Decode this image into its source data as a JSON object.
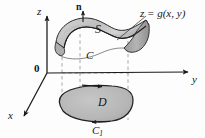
{
  "figure": {
    "axes": {
      "z_label": "z",
      "y_label": "y",
      "x_label": "x",
      "origin_label": "0"
    },
    "labels": {
      "surface": "S",
      "surface_equation_z": "z",
      "surface_equation_eq": "=",
      "surface_equation_fn": "g(x, y)",
      "surface_equation_full": "z = g(x, y)",
      "normal_vector": "n",
      "boundary_curve": "C",
      "region": "D",
      "projected_curve_base": "C",
      "projected_curve_sub": "1",
      "projected_curve_full": "C1"
    },
    "colors": {
      "background": "#fdfdfd",
      "ink": "#151515",
      "axis": "#1a1a1a",
      "dashed": "#9a9a9a",
      "surface_fill_light": "#d8d8d8",
      "surface_fill_mid": "#bdbdbd",
      "surface_fill_dark": "#a0a0a0",
      "region_fill": "#b9b9b9",
      "outline": "#222222"
    },
    "geometry": {
      "origin_point": [
        47,
        73
      ],
      "z_axis_top": [
        47,
        14
      ],
      "y_axis_end": [
        191,
        72
      ],
      "x_axis_end": [
        21,
        118
      ],
      "dashed_verticals_x": [
        62,
        80,
        128
      ],
      "surface_span_x": [
        55,
        150
      ],
      "region_span_x": [
        62,
        133
      ]
    }
  }
}
